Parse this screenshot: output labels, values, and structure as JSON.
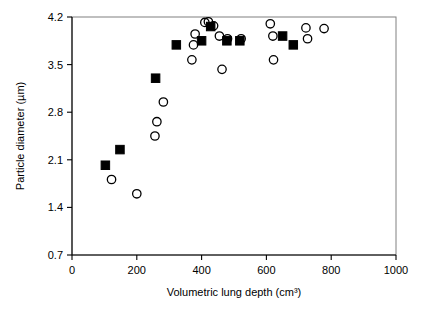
{
  "chart_data": {
    "type": "scatter",
    "title": "",
    "xlabel": "Volumetric lung depth (cm³)",
    "ylabel": "Particle diameter (µm)",
    "xlim": [
      0,
      1000
    ],
    "ylim": [
      0.7,
      4.2
    ],
    "xticks": [
      0,
      200,
      400,
      600,
      800,
      1000
    ],
    "yticks": [
      0.7,
      1.4,
      2.1,
      2.8,
      3.5,
      4.2
    ],
    "xtick_labels": [
      "0",
      "200",
      "400",
      "600",
      "800",
      "1000"
    ],
    "ytick_labels": [
      "0.7",
      "1.4",
      "2.1",
      "2.8",
      "3.5",
      "4.2"
    ],
    "grid": false,
    "legend": "none",
    "frame": "box",
    "marker_color": "#000000",
    "series": [
      {
        "name": "filled-squares",
        "marker": "square-filled",
        "points": [
          [
            103,
            2.02
          ],
          [
            148,
            2.25
          ],
          [
            258,
            3.3
          ],
          [
            322,
            3.79
          ],
          [
            400,
            3.85
          ],
          [
            428,
            4.06
          ],
          [
            478,
            3.85
          ],
          [
            518,
            3.85
          ],
          [
            650,
            3.92
          ],
          [
            683,
            3.79
          ]
        ]
      },
      {
        "name": "open-circles",
        "marker": "circle-open",
        "points": [
          [
            122,
            1.81
          ],
          [
            200,
            1.6
          ],
          [
            256,
            2.45
          ],
          [
            262,
            2.66
          ],
          [
            282,
            2.95
          ],
          [
            370,
            3.57
          ],
          [
            375,
            3.79
          ],
          [
            380,
            3.95
          ],
          [
            410,
            4.12
          ],
          [
            421,
            4.13
          ],
          [
            437,
            4.07
          ],
          [
            455,
            3.92
          ],
          [
            463,
            3.43
          ],
          [
            480,
            3.88
          ],
          [
            522,
            3.88
          ],
          [
            612,
            4.1
          ],
          [
            620,
            3.92
          ],
          [
            622,
            3.57
          ],
          [
            722,
            4.04
          ],
          [
            727,
            3.88
          ],
          [
            778,
            4.03
          ]
        ]
      }
    ]
  },
  "axes": {
    "xlabel": "Volumetric lung depth (cm³)",
    "ylabel": "Particle diameter (µm)"
  }
}
